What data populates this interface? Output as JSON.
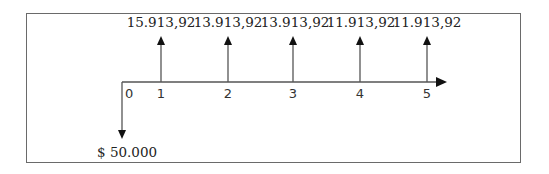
{
  "diagram": {
    "type": "cash-flow",
    "outflow": {
      "period": "0",
      "label": "$ 50.000"
    },
    "inflows": [
      {
        "period": "1",
        "label": "15.913,92"
      },
      {
        "period": "2",
        "label": "13.913,92"
      },
      {
        "period": "3",
        "label": "13.913,92"
      },
      {
        "period": "4",
        "label": "11.913,92"
      },
      {
        "period": "5",
        "label": "11.913,92"
      }
    ],
    "periods": [
      "0",
      "1",
      "2",
      "3",
      "4",
      "5"
    ]
  }
}
